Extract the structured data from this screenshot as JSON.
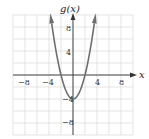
{
  "chart_data": {
    "type": "line",
    "title": "",
    "function": "g(x) = x^2 - 4",
    "xlabel": "x",
    "ylabel": "g(x)",
    "xlim": [
      -10,
      10
    ],
    "ylim": [
      -10,
      10
    ],
    "grid": true,
    "grid_step": 2,
    "x_ticks": [
      -8,
      -4,
      4,
      8
    ],
    "y_ticks": [
      8,
      4,
      -8
    ],
    "x_tick_labels": [
      "−8",
      "−4",
      "4",
      "8"
    ],
    "y_tick_labels": [
      "8",
      "4",
      "−8"
    ],
    "vertex_label": "−4",
    "series": [
      {
        "name": "g(x)",
        "x": [
          -3.74,
          -3,
          -2,
          -1,
          0,
          1,
          2,
          3,
          3.74
        ],
        "y": [
          10,
          5,
          0,
          -3,
          -4,
          -3,
          0,
          5,
          10
        ]
      }
    ],
    "colors": {
      "curve": "#6e6e6e",
      "axis": "#333333",
      "grid": "#d9d9d9"
    }
  }
}
